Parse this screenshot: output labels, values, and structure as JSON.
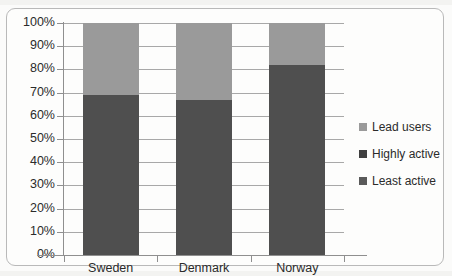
{
  "chart_data": {
    "type": "bar",
    "subtype": "100% stacked column",
    "title": "",
    "xlabel": "",
    "ylabel": "",
    "categories": [
      "Sweden",
      "Denmark",
      "Norway"
    ],
    "series": [
      {
        "name": "Least active",
        "color": "#4f4f4f",
        "values": [
          34,
          33,
          41
        ]
      },
      {
        "name": "Highly active",
        "color": "#4f4f4f",
        "values": [
          35,
          34,
          41
        ]
      },
      {
        "name": "Lead users",
        "color": "#9a9a9a",
        "values": [
          31,
          33,
          18
        ]
      }
    ],
    "stack_boundaries_percent": [
      69,
      67,
      82
    ],
    "ylim": [
      0,
      100
    ],
    "ytick_labels": [
      "0%",
      "10%",
      "20%",
      "30%",
      "40%",
      "50%",
      "60%",
      "70%",
      "80%",
      "90%",
      "100%"
    ],
    "ytick_values": [
      0,
      10,
      20,
      30,
      40,
      50,
      60,
      70,
      80,
      90,
      100
    ],
    "grid": true,
    "legend_position": "right"
  },
  "legend": {
    "items": [
      {
        "label": "Lead users",
        "color": "#9a9a9a"
      },
      {
        "label": "Highly active",
        "color": "#3f3f3f"
      },
      {
        "label": "Least active",
        "color": "#5a5a5a"
      }
    ]
  },
  "colors": {
    "light_segment": "#9a9a9a",
    "dark_segment": "#4f4f4f",
    "gridline": "#a8a8a8",
    "axis": "#8f8f8f",
    "frame": "#b9b9b9",
    "text": "#2b2b2b"
  }
}
